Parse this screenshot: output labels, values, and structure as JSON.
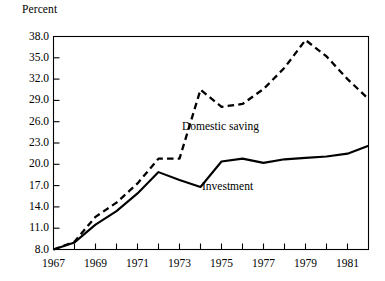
{
  "chart_data": {
    "type": "line",
    "title": "",
    "subtitle": "",
    "xlabel": "",
    "ylabel": "Percent",
    "x": [
      1967,
      1968,
      1969,
      1970,
      1971,
      1972,
      1973,
      1974,
      1975,
      1976,
      1977,
      1978,
      1979,
      1980,
      1981,
      1982
    ],
    "xlim": [
      1967,
      1982
    ],
    "ylim": [
      8.0,
      38.0
    ],
    "y_ticks": [
      8.0,
      11.0,
      14.0,
      17.0,
      20.0,
      23.0,
      26.0,
      29.0,
      32.0,
      35.0,
      38.0
    ],
    "y_tick_labels": [
      "8.0",
      "11.0",
      "14.0",
      "17.0",
      "20.0",
      "23.0",
      "26.0",
      "29.0",
      "32.0",
      "35.0",
      "38.0"
    ],
    "x_ticks": [
      1967,
      1968,
      1969,
      1970,
      1971,
      1972,
      1973,
      1974,
      1975,
      1976,
      1977,
      1978,
      1979,
      1980,
      1981,
      1982
    ],
    "x_tick_labels_shown": [
      "1967",
      "1969",
      "1971",
      "1973",
      "1975",
      "1977",
      "1979",
      "1981"
    ],
    "x_tick_label_years": [
      1967,
      1969,
      1971,
      1973,
      1975,
      1977,
      1979,
      1981
    ],
    "grid": false,
    "legend_position": "inline-annotation",
    "series": [
      {
        "name": "Domestic saving",
        "style": "dashed",
        "color": "#000000",
        "values": [
          8.0,
          9.1,
          12.6,
          14.6,
          17.3,
          20.8,
          20.8,
          30.5,
          28.1,
          28.5,
          30.6,
          33.6,
          37.5,
          35.2,
          32.0,
          29.2
        ]
      },
      {
        "name": "Investment",
        "style": "solid",
        "color": "#000000",
        "values": [
          8.0,
          9.0,
          11.5,
          13.4,
          15.9,
          18.9,
          17.8,
          16.8,
          20.4,
          20.8,
          20.2,
          20.7,
          20.9,
          21.1,
          21.5,
          22.6
        ]
      }
    ],
    "annotations": [
      {
        "text": "Domestic saving",
        "x": 1973.6,
        "y": 26.1
      },
      {
        "text": "Investment",
        "x": 1974.6,
        "y": 17.6
      }
    ]
  },
  "axis": {
    "unit_label": "Percent"
  }
}
